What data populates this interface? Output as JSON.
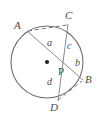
{
  "figure": {
    "type": "circle-with-intersecting-chords",
    "background_color": "#ffffff",
    "stroke_color": "#6e6e6e",
    "label_color": "#4a4a4a",
    "circle": {
      "center_x": 47,
      "center_y": 62,
      "radius": 36
    },
    "center_dot": {
      "x": 47,
      "y": 62,
      "radius": 2.1
    },
    "vertices": [
      {
        "id": "A",
        "label": "A",
        "x": 27,
        "y": 31,
        "label_x": 14,
        "label_y": 20
      },
      {
        "id": "C",
        "label": "C",
        "x": 68,
        "y": 24,
        "label_x": 65,
        "label_y": 10
      },
      {
        "id": "B",
        "label": "B",
        "x": 83,
        "y": 80,
        "label_x": 85,
        "label_y": 74
      },
      {
        "id": "D",
        "label": "D",
        "x": 58,
        "y": 101,
        "label_x": 50,
        "label_y": 102
      }
    ],
    "intersection_point": {
      "id": "P",
      "label": "P",
      "x": 60,
      "y": 68,
      "label_x": 58,
      "label_y": 66
    },
    "solid_chords": [
      {
        "id": "AB",
        "from": "A",
        "to": "B",
        "x1": 27,
        "y1": 31,
        "x2": 83,
        "y2": 80
      },
      {
        "id": "CD",
        "from": "C",
        "to": "D",
        "x1": 68,
        "y1": 24,
        "x2": 58,
        "y2": 101
      }
    ],
    "dashed_chords": [
      {
        "id": "AC",
        "from": "A",
        "to": "C",
        "x1": 28,
        "y1": 31,
        "x2": 67,
        "y2": 25
      },
      {
        "id": "DB",
        "from": "D",
        "to": "B",
        "x1": 58,
        "y1": 100,
        "x2": 82,
        "y2": 81
      }
    ],
    "segment_labels": [
      {
        "id": "a",
        "label": "a",
        "segment": "AP",
        "x": 47,
        "y": 38
      },
      {
        "id": "c",
        "label": "c",
        "segment": "CP",
        "x": 67,
        "y": 41
      },
      {
        "id": "b",
        "label": "b",
        "segment": "PB",
        "x": 75,
        "y": 58
      },
      {
        "id": "d",
        "label": "d",
        "segment": "PD",
        "x": 47,
        "y": 77
      }
    ]
  }
}
